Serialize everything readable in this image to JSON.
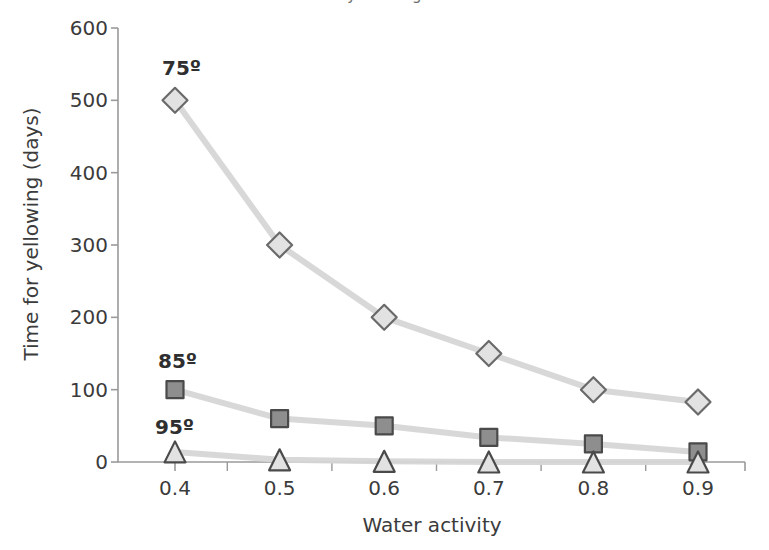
{
  "figure": {
    "title_remnant": "yellowing",
    "background": "#ffffff"
  },
  "chart_data": {
    "type": "line",
    "title": "",
    "xlabel": "Water activity",
    "ylabel": "Time for yellowing (days)",
    "x": [
      0.4,
      0.5,
      0.6,
      0.7,
      0.8,
      0.9
    ],
    "xtick_labels": [
      "0.4",
      "0.5",
      "0.6",
      "0.7",
      "0.8",
      "0.9"
    ],
    "ytick_labels": [
      "0",
      "100",
      "200",
      "300",
      "400",
      "500",
      "600"
    ],
    "yticks": [
      0,
      100,
      200,
      300,
      400,
      500,
      600
    ],
    "xlim": [
      0.36,
      0.95
    ],
    "ylim": [
      0,
      600
    ],
    "grid": false,
    "legend": "inline-annotations",
    "series": [
      {
        "name": "75º",
        "label": "75º",
        "marker": "diamond",
        "values": [
          500,
          300,
          200,
          150,
          100,
          83
        ],
        "line_color": "#d6d6d6",
        "marker_fill": "#e2e2e2",
        "marker_stroke": "#6a6a6a"
      },
      {
        "name": "85º",
        "label": "85º",
        "marker": "square",
        "values": [
          100,
          60,
          50,
          34,
          25,
          14
        ],
        "line_color": "#d6d6d6",
        "marker_fill": "#8e8e8e",
        "marker_stroke": "#4a4a4a"
      },
      {
        "name": "95º",
        "label": "95º",
        "marker": "triangle",
        "values": [
          14,
          3,
          1,
          0,
          0,
          0
        ],
        "line_color": "#d6d6d6",
        "marker_fill": "#e2e2e2",
        "marker_stroke": "#4a4a4a"
      }
    ],
    "annotations": [
      {
        "text": "75º",
        "x_px": 162,
        "y_px": 58
      },
      {
        "text": "85º",
        "x_px": 158,
        "y_px": 351
      },
      {
        "text": "95º",
        "x_px": 155,
        "y_px": 417
      }
    ],
    "axis_color": "#9a9a9a",
    "text_color": "#3b3b3b"
  }
}
